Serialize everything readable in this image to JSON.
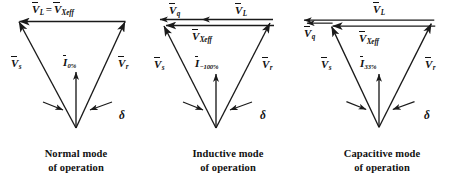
{
  "figure": {
    "type": "phasor-diagram-set",
    "background": "#ffffff",
    "stroke_color": "#1a1a1a",
    "panel_count": 3
  },
  "panels": [
    {
      "id": "normal-mode",
      "caption_line1": "Normal mode",
      "caption_line2": "of operation",
      "top_label": {
        "v_l": "V",
        "v_l_sub": "L",
        "equals": "=",
        "v_x": "V",
        "v_x_sub": "Xeff"
      },
      "left_label": "V",
      "left_label_sub": "s",
      "right_label": "V",
      "right_label_sub": "r",
      "current_label": "I",
      "current_label_sub": "0%",
      "angle_label": "δ",
      "has_split_top": false,
      "top_arrow_direction": "left"
    },
    {
      "id": "inductive-mode",
      "caption_line1": "Inductive mode",
      "caption_line2": "of operation",
      "top_label_q": "V",
      "top_label_q_sub": "q",
      "top_label_l": "V",
      "top_label_l_sub": "L",
      "inner_label": "V",
      "inner_label_sub": "Xeff",
      "left_label": "V",
      "left_label_sub": "s",
      "right_label": "V",
      "right_label_sub": "r",
      "current_label": "I",
      "current_label_sub": "−100%",
      "angle_label": "δ",
      "has_split_top": true,
      "top_arrow_direction": "left"
    },
    {
      "id": "capacitive-mode",
      "caption_line1": "Capacitive mode",
      "caption_line2": "of operation",
      "top_label_l": "V",
      "top_label_l_sub": "L",
      "top_label_q": "V",
      "top_label_q_sub": "q",
      "inner_label": "V",
      "inner_label_sub": "Xeff",
      "left_label": "V",
      "left_label_sub": "s",
      "right_label": "V",
      "right_label_sub": "r",
      "current_label": "I",
      "current_label_sub": "33%",
      "angle_label": "δ",
      "has_split_top": true,
      "top_arrow_direction": "left"
    }
  ]
}
